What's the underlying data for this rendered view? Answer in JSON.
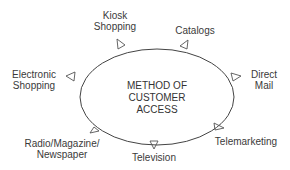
{
  "diagram": {
    "center": {
      "lines": [
        "METHOD OF",
        "CUSTOMER",
        "ACCESS"
      ]
    },
    "nodes": [
      {
        "id": "kiosk",
        "lines": [
          "Kiosk",
          "Shopping"
        ]
      },
      {
        "id": "catalogs",
        "lines": [
          "Catalogs"
        ]
      },
      {
        "id": "direct-mail",
        "lines": [
          "Direct",
          "Mail"
        ]
      },
      {
        "id": "telemarketing",
        "lines": [
          "Telemarketing"
        ]
      },
      {
        "id": "television",
        "lines": [
          "Television"
        ]
      },
      {
        "id": "radio",
        "lines": [
          "Radio/Magazine/",
          "Newspaper"
        ]
      },
      {
        "id": "electronic",
        "lines": [
          "Electronic",
          "Shopping"
        ]
      }
    ],
    "colors": {
      "line": "#444444",
      "text": "#3a3a3a",
      "background": "#ffffff"
    }
  }
}
